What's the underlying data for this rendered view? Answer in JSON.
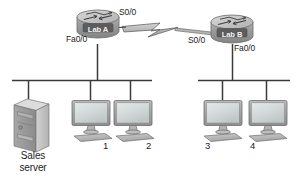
{
  "diagram": {
    "background": "#ffffff",
    "routers": [
      {
        "id": "lab-a",
        "name": "Lab A",
        "serial_label": "S0/0",
        "ethernet_label": "Fa0/0"
      },
      {
        "id": "lab-b",
        "name": "Lab B",
        "serial_label": "S0/0",
        "ethernet_label": "Fa0/0"
      }
    ],
    "wan_link": {
      "type": "serial-lightning-bolt",
      "left_interface": "S0/0",
      "right_interface": "S0/0"
    },
    "server": {
      "name_line1": "Sales",
      "name_line2": "server",
      "icon": "tower-server-icon"
    },
    "workstations": [
      {
        "id": "pc-1",
        "label": "1",
        "segment": "left"
      },
      {
        "id": "pc-2",
        "label": "2",
        "segment": "left"
      },
      {
        "id": "pc-3",
        "label": "3",
        "segment": "right"
      },
      {
        "id": "pc-4",
        "label": "4",
        "segment": "right"
      }
    ],
    "segments": [
      {
        "id": "left-lan",
        "router": "Lab A",
        "devices": [
          "Sales server",
          "1",
          "2"
        ]
      },
      {
        "id": "right-lan",
        "router": "Lab B",
        "devices": [
          "3",
          "4"
        ]
      }
    ],
    "colors": {
      "line": "#3a3a3a",
      "router_body": "#9a9a9a",
      "router_top": "#c9c9c9",
      "router_label_box": "#5c5c5c",
      "screen": "#d7dcdc",
      "bezel": "#a8a8a8",
      "server_face": "#c2c2c2",
      "server_side": "#9d9d9d",
      "text": "#1d1d1d"
    }
  }
}
